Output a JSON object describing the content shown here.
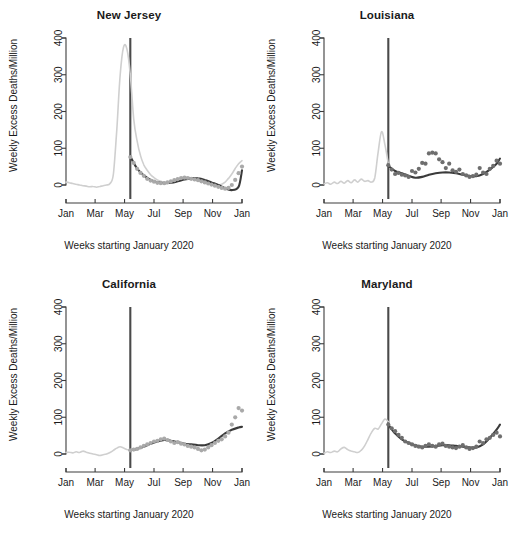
{
  "figure": {
    "axis_label_x": "Weeks starting January 2020",
    "axis_label_y": "Weekly Excess Deaths/Million",
    "x_tick_labels": [
      "Jan",
      "Mar",
      "May",
      "Jul",
      "Sep",
      "Nov",
      "Jan"
    ],
    "y_tick_labels": [
      "0",
      "100",
      "200",
      "300",
      "400"
    ],
    "colors": {
      "observed_line": "#cfcfcf",
      "fitted_line": "#3a3a3a",
      "points": "#a9a9a9",
      "reference_line": "#4a4a4a",
      "axis": "#3c3c3c",
      "background": "#ffffff"
    },
    "panel_titles": [
      "New Jersey",
      "Louisiana",
      "California",
      "Maryland"
    ]
  },
  "chart_data": [
    {
      "type": "line",
      "title": "New Jersey",
      "xlabel": "Weeks starting January 2020",
      "ylabel": "Weekly Excess Deaths/Million",
      "ylim": [
        -60,
        400
      ],
      "yticks": [
        0,
        100,
        200,
        300,
        400
      ],
      "xlim": [
        0,
        52
      ],
      "xticks": [
        0,
        8.6,
        17.3,
        26,
        34.6,
        43.3,
        52
      ],
      "xticklabels": [
        "Jan",
        "Mar",
        "May",
        "Jul",
        "Sep",
        "Nov",
        "Jan"
      ],
      "grid": false,
      "legend": "none",
      "reference_line_x": 19,
      "series": [
        {
          "name": "observed",
          "style": "light-gray-line",
          "x": [
            0,
            1,
            2,
            3,
            4,
            5,
            6,
            7,
            8,
            9,
            10,
            11,
            12,
            13,
            14,
            15,
            16,
            17,
            18,
            19,
            20,
            21,
            22,
            23,
            24,
            25,
            26,
            27,
            28,
            29,
            30,
            31,
            32,
            33,
            34,
            35,
            36,
            37,
            38,
            39,
            40,
            41,
            42,
            43,
            44,
            45,
            46,
            47,
            48,
            49,
            50,
            51,
            52
          ],
          "values": [
            8,
            6,
            4,
            2,
            0,
            -2,
            -3,
            -5,
            -4,
            -6,
            -4,
            -2,
            0,
            4,
            30,
            150,
            300,
            375,
            370,
            300,
            180,
            120,
            80,
            55,
            40,
            28,
            20,
            14,
            10,
            8,
            7,
            9,
            12,
            16,
            19,
            21,
            20,
            18,
            15,
            12,
            10,
            8,
            6,
            4,
            2,
            0,
            2,
            8,
            18,
            30,
            45,
            58,
            66
          ]
        },
        {
          "name": "fitted",
          "style": "dark-line",
          "x": [
            19,
            21,
            23,
            25,
            27,
            29,
            31,
            33,
            35,
            37,
            39,
            41,
            43,
            45,
            47,
            49,
            51,
            52
          ],
          "values": [
            78,
            45,
            26,
            14,
            8,
            5,
            6,
            10,
            15,
            18,
            18,
            14,
            7,
            0,
            -9,
            -14,
            -5,
            40
          ]
        },
        {
          "name": "weekly_points",
          "style": "gray-points",
          "x": [
            19,
            20,
            21,
            22,
            23,
            24,
            25,
            26,
            27,
            28,
            29,
            30,
            31,
            32,
            33,
            34,
            35,
            36,
            37,
            38,
            39,
            40,
            41,
            42,
            43,
            44,
            45,
            46,
            47,
            48,
            49,
            50,
            51,
            52
          ],
          "values": [
            76,
            60,
            44,
            33,
            25,
            17,
            12,
            9,
            6,
            5,
            5,
            7,
            10,
            13,
            16,
            19,
            20,
            19,
            17,
            15,
            13,
            10,
            7,
            4,
            1,
            -2,
            -5,
            -8,
            -10,
            -8,
            0,
            14,
            32,
            50
          ]
        }
      ]
    },
    {
      "type": "line",
      "title": "Louisiana",
      "xlabel": "Weeks starting January 2020",
      "ylabel": "Weekly Excess Deaths/Million",
      "ylim": [
        -60,
        400
      ],
      "yticks": [
        0,
        100,
        200,
        300,
        400
      ],
      "xlim": [
        0,
        52
      ],
      "xticks": [
        0,
        8.6,
        17.3,
        26,
        34.6,
        43.3,
        52
      ],
      "xticklabels": [
        "Jan",
        "Mar",
        "May",
        "Jul",
        "Sep",
        "Nov",
        "Jan"
      ],
      "grid": false,
      "legend": "none",
      "reference_line_x": 19,
      "series": [
        {
          "name": "observed",
          "style": "light-gray-line",
          "x": [
            0,
            1,
            2,
            3,
            4,
            5,
            6,
            7,
            8,
            9,
            10,
            11,
            12,
            13,
            14,
            15,
            16,
            17,
            18,
            19
          ],
          "values": [
            3,
            6,
            2,
            8,
            4,
            10,
            5,
            12,
            6,
            14,
            8,
            16,
            10,
            12,
            8,
            20,
            90,
            145,
            110,
            58
          ]
        },
        {
          "name": "fitted",
          "style": "dark-line",
          "x": [
            19,
            21,
            23,
            25,
            27,
            29,
            31,
            33,
            35,
            37,
            39,
            41,
            43,
            45,
            47,
            49,
            51,
            52
          ],
          "values": [
            52,
            38,
            32,
            25,
            20,
            22,
            28,
            32,
            34,
            34,
            32,
            28,
            25,
            24,
            30,
            42,
            58,
            72
          ]
        },
        {
          "name": "weekly_points",
          "style": "gray-points",
          "x": [
            19,
            20,
            21,
            22,
            23,
            24,
            25,
            26,
            27,
            28,
            29,
            30,
            31,
            32,
            33,
            34,
            35,
            36,
            37,
            38,
            39,
            40,
            41,
            42,
            43,
            44,
            45,
            46,
            47,
            48,
            49,
            50,
            51,
            52
          ],
          "values": [
            54,
            42,
            30,
            33,
            28,
            26,
            22,
            38,
            34,
            44,
            60,
            58,
            86,
            88,
            86,
            70,
            62,
            46,
            58,
            40,
            36,
            42,
            30,
            26,
            22,
            24,
            28,
            46,
            34,
            30,
            44,
            52,
            66,
            58
          ]
        }
      ]
    },
    {
      "type": "line",
      "title": "California",
      "xlabel": "Weeks starting January 2020",
      "ylabel": "Weekly Excess Deaths/Million",
      "ylim": [
        -60,
        400
      ],
      "yticks": [
        0,
        100,
        200,
        300,
        400
      ],
      "xlim": [
        0,
        52
      ],
      "xticks": [
        0,
        8.6,
        17.3,
        26,
        34.6,
        43.3,
        52
      ],
      "xticklabels": [
        "Jan",
        "Mar",
        "May",
        "Jul",
        "Sep",
        "Nov",
        "Jan"
      ],
      "grid": false,
      "legend": "none",
      "reference_line_x": 19,
      "series": [
        {
          "name": "observed",
          "style": "light-gray-line",
          "x": [
            0,
            1,
            2,
            3,
            4,
            5,
            6,
            7,
            8,
            9,
            10,
            11,
            12,
            13,
            14,
            15,
            16,
            17,
            18,
            19
          ],
          "values": [
            4,
            5,
            3,
            6,
            4,
            8,
            5,
            2,
            0,
            -2,
            -4,
            -2,
            0,
            4,
            10,
            16,
            20,
            16,
            12,
            10
          ]
        },
        {
          "name": "fitted",
          "style": "dark-line",
          "x": [
            19,
            21,
            23,
            25,
            27,
            29,
            31,
            33,
            35,
            37,
            39,
            41,
            43,
            45,
            47,
            49,
            51,
            52
          ],
          "values": [
            10,
            14,
            20,
            28,
            34,
            38,
            36,
            32,
            28,
            26,
            24,
            24,
            30,
            42,
            56,
            66,
            72,
            74
          ]
        },
        {
          "name": "weekly_points",
          "style": "gray-points",
          "x": [
            19,
            20,
            21,
            22,
            23,
            24,
            25,
            26,
            27,
            28,
            29,
            30,
            31,
            32,
            33,
            34,
            35,
            36,
            37,
            38,
            39,
            40,
            41,
            42,
            43,
            44,
            45,
            46,
            47,
            48,
            49,
            50,
            51,
            52
          ],
          "values": [
            10,
            12,
            14,
            18,
            22,
            26,
            30,
            34,
            36,
            40,
            42,
            38,
            34,
            30,
            32,
            28,
            26,
            22,
            20,
            18,
            14,
            10,
            12,
            18,
            24,
            30,
            36,
            40,
            48,
            58,
            80,
            100,
            125,
            118
          ]
        }
      ]
    },
    {
      "type": "line",
      "title": "Maryland",
      "xlabel": "Weeks starting January 2020",
      "ylabel": "Weekly Excess Deaths/Million",
      "ylim": [
        -60,
        400
      ],
      "yticks": [
        0,
        100,
        200,
        300,
        400
      ],
      "xlim": [
        0,
        52
      ],
      "xticks": [
        0,
        8.6,
        17.3,
        26,
        34.6,
        43.3,
        52
      ],
      "xticklabels": [
        "Jan",
        "Mar",
        "May",
        "Jul",
        "Sep",
        "Nov",
        "Jan"
      ],
      "grid": false,
      "legend": "none",
      "reference_line_x": 19,
      "series": [
        {
          "name": "observed",
          "style": "light-gray-line",
          "x": [
            0,
            1,
            2,
            3,
            4,
            5,
            6,
            7,
            8,
            9,
            10,
            11,
            12,
            13,
            14,
            15,
            16,
            17,
            18,
            19
          ],
          "values": [
            2,
            6,
            4,
            8,
            6,
            14,
            18,
            12,
            8,
            6,
            4,
            10,
            22,
            40,
            58,
            70,
            68,
            82,
            95,
            88
          ]
        },
        {
          "name": "fitted",
          "style": "dark-line",
          "x": [
            19,
            21,
            23,
            25,
            27,
            29,
            31,
            33,
            35,
            37,
            39,
            41,
            43,
            45,
            47,
            49,
            51,
            52
          ],
          "values": [
            80,
            56,
            40,
            30,
            24,
            20,
            20,
            22,
            24,
            24,
            22,
            20,
            18,
            18,
            26,
            44,
            66,
            80
          ]
        },
        {
          "name": "weekly_points",
          "style": "gray-points",
          "x": [
            19,
            20,
            21,
            22,
            23,
            24,
            25,
            26,
            27,
            28,
            29,
            30,
            31,
            32,
            33,
            34,
            35,
            36,
            37,
            38,
            39,
            40,
            41,
            42,
            43,
            44,
            45,
            46,
            47,
            48,
            49,
            50,
            51,
            52
          ],
          "values": [
            80,
            70,
            62,
            52,
            44,
            34,
            30,
            26,
            22,
            20,
            18,
            22,
            26,
            22,
            20,
            26,
            28,
            22,
            20,
            18,
            16,
            20,
            24,
            18,
            14,
            16,
            20,
            34,
            30,
            40,
            44,
            52,
            58,
            48
          ]
        }
      ]
    }
  ]
}
